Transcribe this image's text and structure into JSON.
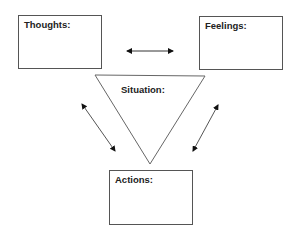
{
  "diagram": {
    "nodes": {
      "thoughts": {
        "label": "Thoughts:"
      },
      "feelings": {
        "label": "Feelings:"
      },
      "situation": {
        "label": "Situation:"
      },
      "actions": {
        "label": "Actions:"
      }
    },
    "edges": [
      {
        "from": "thoughts",
        "to": "feelings",
        "type": "bidirectional"
      },
      {
        "from": "thoughts",
        "to": "actions",
        "type": "bidirectional"
      },
      {
        "from": "feelings",
        "to": "actions",
        "type": "bidirectional"
      }
    ],
    "colors": {
      "stroke": "#555555",
      "text": "#222222",
      "background": "#ffffff"
    }
  }
}
